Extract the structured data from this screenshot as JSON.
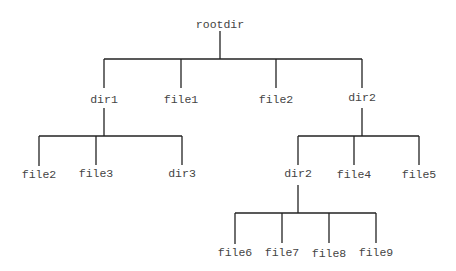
{
  "diagram": {
    "type": "tree",
    "colors": {
      "line": "#222222",
      "text": "#444444",
      "background": "#ffffff"
    },
    "nodes": {
      "root": {
        "label": "rootdir",
        "x": 220,
        "y": 28
      },
      "dir1": {
        "label": "dir1",
        "x": 104,
        "y": 103
      },
      "file1": {
        "label": "file1",
        "x": 181,
        "y": 103
      },
      "file2_top": {
        "label": "file2",
        "x": 276,
        "y": 103
      },
      "dir2": {
        "label": "dir2",
        "x": 362,
        "y": 101
      },
      "file2_sub": {
        "label": "file2",
        "x": 39,
        "y": 178
      },
      "file3": {
        "label": "file3",
        "x": 96,
        "y": 177
      },
      "dir3": {
        "label": "dir3",
        "x": 182,
        "y": 177
      },
      "dir2_sub": {
        "label": "dir2",
        "x": 298,
        "y": 177
      },
      "file4": {
        "label": "file4",
        "x": 354,
        "y": 178
      },
      "file5": {
        "label": "file5",
        "x": 419,
        "y": 178
      },
      "file6": {
        "label": "file6",
        "x": 235,
        "y": 256
      },
      "file7": {
        "label": "file7",
        "x": 282,
        "y": 256
      },
      "file8": {
        "label": "file8",
        "x": 329,
        "y": 257
      },
      "file9": {
        "label": "file9",
        "x": 376,
        "y": 256
      }
    },
    "edges": [
      [
        "root",
        "dir1"
      ],
      [
        "root",
        "file1"
      ],
      [
        "root",
        "file2_top"
      ],
      [
        "root",
        "dir2"
      ],
      [
        "dir1",
        "file2_sub"
      ],
      [
        "dir1",
        "file3"
      ],
      [
        "dir1",
        "dir3"
      ],
      [
        "dir2",
        "dir2_sub"
      ],
      [
        "dir2",
        "file4"
      ],
      [
        "dir2",
        "file5"
      ],
      [
        "dir2_sub",
        "file6"
      ],
      [
        "dir2_sub",
        "file7"
      ],
      [
        "dir2_sub",
        "file8"
      ],
      [
        "dir2_sub",
        "file9"
      ]
    ]
  }
}
